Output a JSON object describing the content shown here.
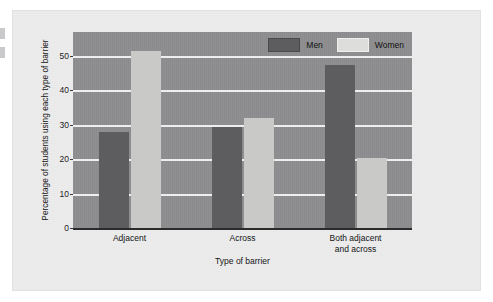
{
  "chart_data": {
    "type": "bar",
    "title": "",
    "xlabel": "Type of barrier",
    "ylabel": "Percentage of students using each type of barrier",
    "categories": [
      "Adjacent",
      "Across",
      "Both adjacent and across"
    ],
    "category_lines": [
      [
        "Adjacent"
      ],
      [
        "Across"
      ],
      [
        "Both adjacent",
        "and across"
      ]
    ],
    "series": [
      {
        "name": "Men",
        "color": "#5d5d60",
        "values": [
          28,
          29.5,
          47.5
        ]
      },
      {
        "name": "Women",
        "color": "#c9c9c7",
        "values": [
          51.5,
          32,
          20.5
        ]
      }
    ],
    "ylim": [
      0,
      57
    ],
    "yticks": [
      0,
      10,
      20,
      30,
      40,
      50
    ],
    "ytick_labels": [
      "0",
      "10",
      "20",
      "30",
      "40",
      "50"
    ],
    "grid": true,
    "legend_position": "top-right",
    "plot_background": "#8e8e90",
    "gridline_color": "#eeeeee",
    "page_background": "#ececed"
  },
  "legend": {
    "items": [
      {
        "label": "Men",
        "swatch": "men"
      },
      {
        "label": "Women",
        "swatch": "women"
      }
    ]
  }
}
